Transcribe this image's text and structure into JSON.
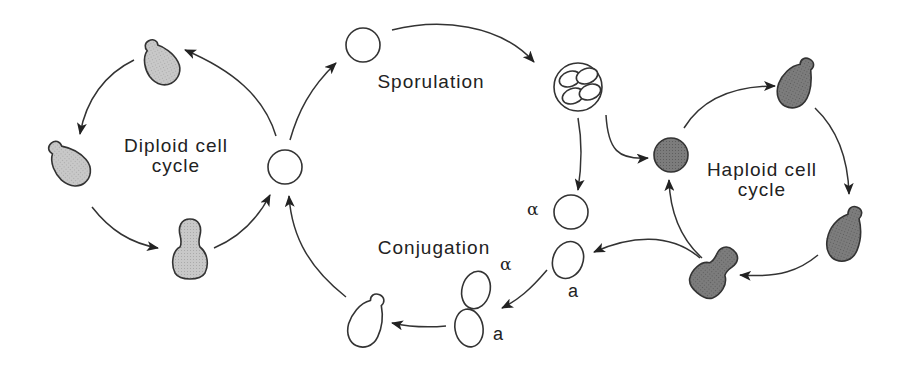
{
  "diagram": {
    "colors": {
      "diploid_fill": "#c4c4c4",
      "haploid_fill": "#7a7a7a",
      "outline": "#333333",
      "background": "#ffffff"
    },
    "labels": {
      "diploid_line1": "Diploid cell",
      "diploid_line2": "cycle",
      "haploid_line1": "Haploid cell",
      "haploid_line2": "cycle",
      "sporulation": "Sporulation",
      "conjugation": "Conjugation",
      "alpha_spore": "α",
      "a_spore": "a",
      "alpha_mating": "α",
      "a_mating": "a"
    },
    "nodes": [
      {
        "id": "diploid-bud-top",
        "cycle": "diploid"
      },
      {
        "id": "diploid-bud-left",
        "cycle": "diploid"
      },
      {
        "id": "diploid-dividing",
        "cycle": "diploid"
      },
      {
        "id": "diploid-cell",
        "cycle": "hub"
      },
      {
        "id": "sporulating-cell",
        "cycle": "sporulation"
      },
      {
        "id": "ascus-four-spores",
        "cycle": "sporulation"
      },
      {
        "id": "alpha-spore",
        "cycle": "spores"
      },
      {
        "id": "a-spore",
        "cycle": "spores"
      },
      {
        "id": "mating-pair",
        "cycle": "conjugation"
      },
      {
        "id": "zygote",
        "cycle": "conjugation"
      },
      {
        "id": "haploid-cell",
        "cycle": "haploid"
      },
      {
        "id": "haploid-bud-top",
        "cycle": "haploid"
      },
      {
        "id": "haploid-bud-right",
        "cycle": "haploid"
      },
      {
        "id": "haploid-dividing",
        "cycle": "haploid"
      }
    ]
  }
}
